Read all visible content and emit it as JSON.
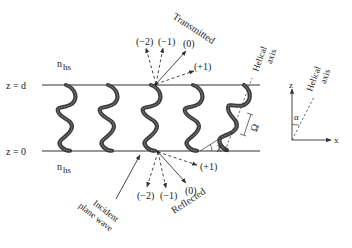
{
  "diagram": {
    "type": "chiral sculptured thin film grating schematic",
    "labels": {
      "z_top": "z = d",
      "z_bottom": "z = 0",
      "n_top": "n",
      "n_top_sub": "hs",
      "n_bottom": "n",
      "n_bottom_sub": "hs",
      "transmitted": "Transmitted",
      "reflected": "Reflected",
      "incident_line1": "Incident",
      "incident_line2": "plane wave",
      "helical_axis_line1": "Helical",
      "helical_axis_line2": "axis",
      "omega": "Ω",
      "chi": "χ",
      "chi_sub": "s",
      "alpha": "α",
      "axis_z": "z",
      "axis_x": "x"
    },
    "transmitted_orders": [
      "(−2)",
      "(−1)",
      "(0)",
      "(+1)"
    ],
    "reflected_orders": [
      "(−2)",
      "(−1)",
      "(0)",
      "(+1)"
    ],
    "helix_count": 5,
    "colors": {
      "line": "#333333",
      "helix": "#3a3a3a",
      "background": "#ffffff"
    }
  }
}
